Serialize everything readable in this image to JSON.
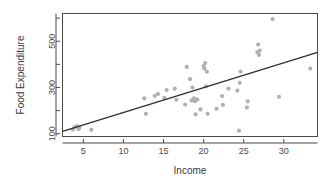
{
  "chart_data": {
    "type": "scatter",
    "title": "",
    "xlabel": "Income",
    "ylabel": "Food Expenditure",
    "xlim": [
      2.4,
      34.2
    ],
    "ylim": [
      88,
      620
    ],
    "grid": false,
    "legend": null,
    "xticks": [
      5,
      10,
      15,
      20,
      25,
      30
    ],
    "xtick_labels": [
      "5",
      "10",
      "15",
      "20",
      "25",
      "30"
    ],
    "yticks": [
      100,
      300,
      500
    ],
    "ytick_labels": [
      "100",
      "300",
      "500"
    ],
    "yminor_ticks": [
      200,
      400,
      600
    ],
    "point_color": "#b0b0b0",
    "line_color": "#2e2e2e",
    "frame_color": "#4a4a4a",
    "series": [
      {
        "name": "observations",
        "marker": "circle",
        "points": [
          [
            3.7,
            118
          ],
          [
            3.9,
            128
          ],
          [
            4.2,
            133
          ],
          [
            4.4,
            120
          ],
          [
            4.5,
            127
          ],
          [
            6.0,
            117
          ],
          [
            12.6,
            253
          ],
          [
            12.8,
            186
          ],
          [
            13.9,
            264
          ],
          [
            14.3,
            272
          ],
          [
            15.1,
            255
          ],
          [
            15.4,
            289
          ],
          [
            16.4,
            295
          ],
          [
            16.6,
            247
          ],
          [
            17.7,
            226
          ],
          [
            17.9,
            389
          ],
          [
            18.3,
            336
          ],
          [
            18.5,
            244
          ],
          [
            18.6,
            300
          ],
          [
            18.8,
            253
          ],
          [
            18.9,
            241
          ],
          [
            19.0,
            184
          ],
          [
            19.2,
            248
          ],
          [
            19.6,
            205
          ],
          [
            20.0,
            393
          ],
          [
            20.1,
            382
          ],
          [
            20.2,
            406
          ],
          [
            20.3,
            305
          ],
          [
            20.4,
            368
          ],
          [
            20.5,
            186
          ],
          [
            21.6,
            208
          ],
          [
            22.3,
            263
          ],
          [
            22.4,
            225
          ],
          [
            23.1,
            295
          ],
          [
            24.2,
            286
          ],
          [
            24.4,
            113
          ],
          [
            24.5,
            320
          ],
          [
            24.6,
            369
          ],
          [
            25.4,
            213
          ],
          [
            25.5,
            240
          ],
          [
            26.7,
            453
          ],
          [
            26.8,
            486
          ],
          [
            26.9,
            441
          ],
          [
            27.0,
            460
          ],
          [
            28.6,
            596
          ],
          [
            29.4,
            260
          ],
          [
            33.3,
            382
          ]
        ]
      }
    ],
    "fit_line": {
      "name": "regression-line",
      "x_start": 2.4,
      "y_start": 110,
      "x_end": 34.2,
      "y_end": 452
    }
  }
}
